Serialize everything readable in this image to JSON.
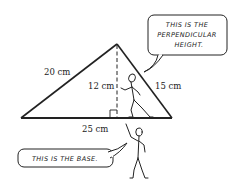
{
  "diagram": {
    "type": "triangle-area-illustration",
    "labels": {
      "left_side": "20 cm",
      "height": "12 cm",
      "right_side": "15 cm",
      "base": "25 cm"
    },
    "bubbles": {
      "height_bubble": [
        "THIS IS THE",
        "PERPENDICULAR",
        "HEIGHT."
      ],
      "base_bubble": "THIS IS THE BASE."
    },
    "colors": {
      "line": "#222222",
      "background": "#ffffff"
    }
  }
}
